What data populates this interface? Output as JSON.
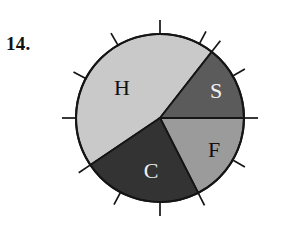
{
  "figure": {
    "item_number": "14.",
    "background_color": "#ffffff",
    "outline_color": "#151515"
  },
  "chart_data": {
    "type": "pie",
    "title": "",
    "xlabel": "",
    "ylabel": "",
    "grid": false,
    "legend": "none",
    "center": {
      "x": 160,
      "y": 118
    },
    "radius": 84,
    "labels": [
      "H",
      "S",
      "F",
      "C"
    ],
    "start_angles_deg": [
      52,
      0,
      297,
      214
    ],
    "end_angles_deg": [
      214,
      52,
      0,
      297
    ],
    "sweep_deg": [
      162,
      52,
      63,
      83
    ],
    "values": [
      162,
      52,
      63,
      83
    ],
    "fractions": [
      0.45,
      0.144,
      0.175,
      0.231
    ],
    "slices": [
      {
        "label": "H",
        "fill": "#c9c9c9",
        "text_color": "#111111",
        "start_angle_deg": 52,
        "end_angle_deg": 214,
        "sweep_deg": 162,
        "label_x": 122,
        "label_y": 90
      },
      {
        "label": "S",
        "fill": "#5b5b5b",
        "text_color": "#f2f2f2",
        "start_angle_deg": 0,
        "end_angle_deg": 52,
        "sweep_deg": 52,
        "label_x": 216,
        "label_y": 93
      },
      {
        "label": "F",
        "fill": "#9b9b9b",
        "text_color": "#111111",
        "start_angle_deg": 297,
        "end_angle_deg": 0,
        "sweep_deg": 63,
        "label_x": 214,
        "label_y": 152
      },
      {
        "label": "C",
        "fill": "#333333",
        "text_color": "#f2f2f2",
        "start_angle_deg": 214,
        "end_angle_deg": 297,
        "sweep_deg": 83,
        "label_x": 151,
        "label_y": 173
      }
    ],
    "ticks": {
      "count": 12,
      "inner_radius": 84,
      "outer_radius": 98,
      "angles_deg": [
        0,
        30,
        52,
        62,
        90,
        120,
        152,
        180,
        214,
        242,
        270,
        297,
        330
      ]
    }
  }
}
